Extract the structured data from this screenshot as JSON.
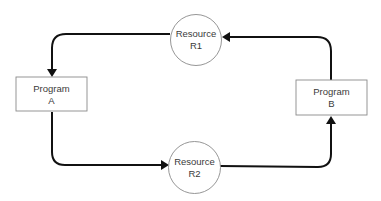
{
  "diagram": {
    "type": "resource-allocation-cycle",
    "nodes": [
      {
        "id": "program-a",
        "kind": "program",
        "line1": "Program",
        "line2": "A"
      },
      {
        "id": "program-b",
        "kind": "program",
        "line1": "Program",
        "line2": "B"
      },
      {
        "id": "resource-r1",
        "kind": "resource",
        "line1": "Resource",
        "line2": "R1"
      },
      {
        "id": "resource-r2",
        "kind": "resource",
        "line1": "Resource",
        "line2": "R2"
      }
    ],
    "edges": [
      {
        "from": "resource-r1",
        "to": "program-a"
      },
      {
        "from": "program-a",
        "to": "resource-r2"
      },
      {
        "from": "resource-r2",
        "to": "program-b"
      },
      {
        "from": "program-b",
        "to": "resource-r1"
      }
    ],
    "colors": {
      "edge": "#111111",
      "node_border": "#8a8a8a",
      "text": "#3a3a3a"
    }
  }
}
